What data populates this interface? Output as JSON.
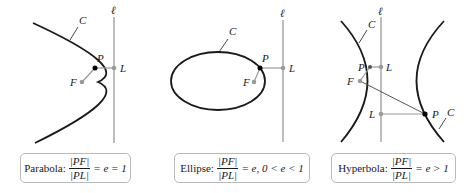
{
  "panels": [
    {
      "type": "parabola",
      "labels": {
        "curve": "C",
        "directrix": "ℓ",
        "point": "P",
        "foot": "L",
        "focus": "F"
      },
      "caption": {
        "name": "Parabola:",
        "numerator": "|PF|",
        "denominator": "|PL|",
        "relation": "= e = 1"
      }
    },
    {
      "type": "ellipse",
      "labels": {
        "curve": "C",
        "directrix": "ℓ",
        "point": "P",
        "foot": "L",
        "focus": "F"
      },
      "caption": {
        "name": "Ellipse:",
        "numerator": "|PF|",
        "denominator": "|PL|",
        "relation": "= e, 0 < e < 1"
      }
    },
    {
      "type": "hyperbola",
      "labels": {
        "curve_left": "C",
        "curve_right": "C",
        "directrix": "ℓ",
        "point_upper": "P",
        "foot_upper": "L",
        "focus": "F",
        "foot_lower": "L",
        "point_lower": "P"
      },
      "caption": {
        "name": "Hyperbola:",
        "numerator": "|PF|",
        "denominator": "|PL|",
        "relation": "= e > 1"
      }
    }
  ],
  "colors": {
    "curve": "#1a1a1a",
    "directrix": "#9a9a9a",
    "point_gray": "#9a9a9a",
    "point_black": "#000000",
    "box_border": "#b9b9b9"
  }
}
